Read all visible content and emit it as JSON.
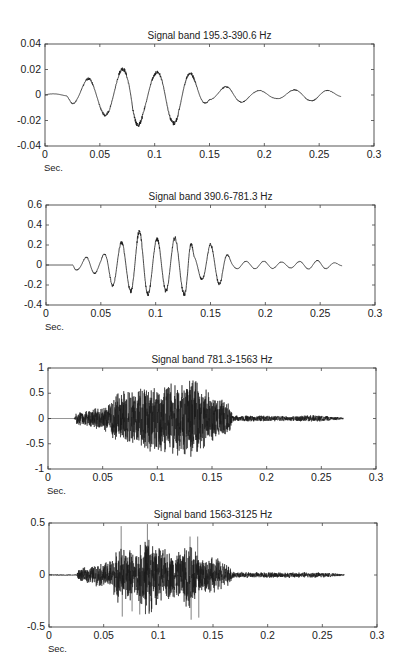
{
  "chart_data": [
    {
      "type": "line",
      "title": "Signal band 195.3-390.6 Hz",
      "xlabel": "Sec.",
      "ylabel": "",
      "xlim": [
        0,
        0.3
      ],
      "ylim": [
        -0.04,
        0.04
      ],
      "xticks": [
        "0",
        "0.05",
        "0.1",
        "0.15",
        "0.2",
        "0.25",
        "0.3"
      ],
      "yticks": [
        "0.04",
        "0.02",
        "0",
        "-0.02",
        "-0.04"
      ],
      "grid": false,
      "signal_span_sec": [
        0,
        0.27
      ],
      "envelope": {
        "t": [
          0,
          0.02,
          0.025,
          0.04,
          0.06,
          0.075,
          0.08,
          0.09,
          0.1,
          0.11,
          0.12,
          0.13,
          0.14,
          0.15,
          0.17,
          0.19,
          0.21,
          0.235,
          0.25,
          0.27
        ],
        "amp": [
          0.001,
          0.001,
          0.008,
          0.014,
          0.018,
          0.024,
          0.032,
          0.02,
          0.018,
          0.024,
          0.024,
          0.02,
          0.014,
          0.004,
          0.008,
          0.004,
          0.003,
          0.005,
          0.005,
          0.002
        ]
      },
      "dominant_freq_hz": 290
    },
    {
      "type": "line",
      "title": "Signal band 390.6-781.3 Hz",
      "xlabel": "Sec.",
      "ylabel": "",
      "xlim": [
        0,
        0.3
      ],
      "ylim": [
        -0.4,
        0.6
      ],
      "xticks": [
        "0",
        "0.05",
        "0.1",
        "0.15",
        "0.2",
        "0.25",
        "0.3"
      ],
      "yticks": [
        "0.6",
        "0.4",
        "0.2",
        "0",
        "-0.2",
        "-0.4"
      ],
      "grid": false,
      "signal_span_sec": [
        0,
        0.27
      ],
      "envelope": {
        "t": [
          0,
          0.024,
          0.026,
          0.03,
          0.04,
          0.05,
          0.06,
          0.075,
          0.085,
          0.1,
          0.11,
          0.125,
          0.13,
          0.135,
          0.15,
          0.16,
          0.17,
          0.2,
          0.22,
          0.25,
          0.27
        ],
        "amp": [
          0.0,
          0.0,
          0.06,
          0.05,
          0.1,
          0.08,
          0.22,
          0.26,
          0.37,
          0.28,
          0.28,
          0.3,
          0.4,
          0.1,
          0.22,
          0.2,
          0.04,
          0.04,
          0.03,
          0.05,
          0.01
        ]
      },
      "dominant_freq_hz": 560
    },
    {
      "type": "line",
      "title": "Signal band 781.3-1563 Hz",
      "xlabel": "Sec.",
      "ylabel": "",
      "xlim": [
        0,
        0.3
      ],
      "ylim": [
        -1,
        1
      ],
      "xticks": [
        "0",
        "0.05",
        "0.1",
        "0.15",
        "0.2",
        "0.25",
        "0.3"
      ],
      "yticks": [
        "1",
        "0.5",
        "0",
        "-0.5",
        "-1"
      ],
      "grid": false,
      "signal_span_sec": [
        0,
        0.27
      ],
      "envelope": {
        "t": [
          0,
          0.024,
          0.026,
          0.04,
          0.055,
          0.065,
          0.08,
          0.09,
          0.1,
          0.12,
          0.135,
          0.15,
          0.165,
          0.17,
          0.2,
          0.22,
          0.245,
          0.27
        ],
        "amp": [
          0.0,
          0.0,
          0.12,
          0.18,
          0.3,
          0.55,
          0.6,
          0.7,
          0.65,
          0.75,
          0.8,
          0.45,
          0.35,
          0.06,
          0.06,
          0.05,
          0.07,
          0.02
        ]
      },
      "dominant_freq_hz": 1100
    },
    {
      "type": "line",
      "title": "Signal band 1563-3125 Hz",
      "xlabel": "Sec.",
      "ylabel": "",
      "xlim": [
        0,
        0.3
      ],
      "ylim": [
        -0.5,
        0.5
      ],
      "xticks": [
        "0",
        "0.05",
        "0.1",
        "0.15",
        "0.2",
        "0.25",
        "0.3"
      ],
      "yticks": [
        "0.5",
        "0",
        "-0.5"
      ],
      "grid": false,
      "signal_span_sec": [
        0,
        0.27
      ],
      "envelope": {
        "t": [
          0,
          0.025,
          0.027,
          0.04,
          0.055,
          0.065,
          0.08,
          0.09,
          0.1,
          0.12,
          0.13,
          0.14,
          0.155,
          0.165,
          0.17,
          0.2,
          0.23,
          0.245,
          0.27
        ],
        "amp": [
          0.005,
          0.005,
          0.06,
          0.1,
          0.15,
          0.3,
          0.25,
          0.45,
          0.28,
          0.24,
          0.4,
          0.2,
          0.18,
          0.1,
          0.03,
          0.03,
          0.03,
          0.03,
          0.01
        ]
      },
      "spikes": [
        {
          "t": 0.066,
          "v": 0.47
        },
        {
          "t": 0.067,
          "v": -0.4
        },
        {
          "t": 0.09,
          "v": 0.49
        },
        {
          "t": 0.092,
          "v": -0.35
        },
        {
          "t": 0.129,
          "v": 0.37
        },
        {
          "t": 0.13,
          "v": -0.43
        },
        {
          "t": 0.136,
          "v": 0.37
        },
        {
          "t": 0.137,
          "v": -0.41
        },
        {
          "t": 0.076,
          "v": -0.35
        },
        {
          "t": 0.083,
          "v": -0.38
        }
      ],
      "dominant_freq_hz": 2200
    }
  ],
  "layout": {
    "panels": [
      {
        "left": 45,
        "top": 44,
        "right": 374,
        "bottom": 146
      },
      {
        "left": 46,
        "top": 205,
        "right": 375,
        "bottom": 305
      },
      {
        "left": 48,
        "top": 368,
        "right": 376,
        "bottom": 469
      },
      {
        "left": 49,
        "top": 523,
        "right": 377,
        "bottom": 627
      }
    ]
  }
}
